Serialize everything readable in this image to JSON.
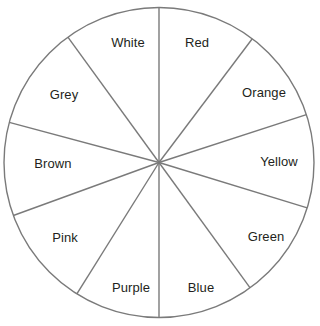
{
  "figure": {
    "type": "pie-wheel",
    "title": "",
    "background_color": "#ffffff",
    "stroke_color": "#7a7a7a",
    "stroke_width": 1.4,
    "fill_color": "#ffffff",
    "label_color": "#231f20",
    "label_font_size_px": 13,
    "center": {
      "x": 159,
      "y": 162.5
    },
    "radius": 155
  },
  "chart_data": {
    "type": "pie",
    "title": "",
    "xlabel": "",
    "ylabel": "",
    "legend_position": "none",
    "grid": false,
    "note": "Spinner wheel divided into 10 unequal sectors, each labelled with a colour name. Sector boundary angles measured in degrees counter-clockwise from the positive x-axis (3 o'clock).",
    "categories": [
      "Red",
      "Orange",
      "Yellow",
      "Green",
      "Blue",
      "Purple",
      "Pink",
      "Brown",
      "Grey",
      "White"
    ],
    "values": [
      37,
      35,
      35,
      37,
      36,
      32,
      38,
      35,
      39,
      36
    ],
    "unit": "degrees",
    "total_degrees": 360,
    "sectors": [
      {
        "label": "Red",
        "start_deg": 53,
        "end_deg": 90,
        "span_deg": 37,
        "label_x": 197,
        "label_y": 43
      },
      {
        "label": "Orange",
        "start_deg": 18,
        "end_deg": 53,
        "span_deg": 35,
        "label_x": 264,
        "label_y": 93
      },
      {
        "label": "Yellow",
        "start_deg": -17,
        "end_deg": 18,
        "span_deg": 35,
        "label_x": 279,
        "label_y": 162
      },
      {
        "label": "Green",
        "start_deg": -54,
        "end_deg": -17,
        "span_deg": 37,
        "label_x": 266,
        "label_y": 237
      },
      {
        "label": "Blue",
        "start_deg": -90,
        "end_deg": -54,
        "span_deg": 36,
        "label_x": 201,
        "label_y": 288
      },
      {
        "label": "Purple",
        "start_deg": -122,
        "end_deg": -90,
        "span_deg": 32,
        "label_x": 131,
        "label_y": 288
      },
      {
        "label": "Pink",
        "start_deg": -160,
        "end_deg": -122,
        "span_deg": 38,
        "label_x": 65,
        "label_y": 238
      },
      {
        "label": "Brown",
        "start_deg": 165,
        "end_deg": 200,
        "span_deg": 35,
        "label_x": 53,
        "label_y": 164
      },
      {
        "label": "Grey",
        "start_deg": 126,
        "end_deg": 165,
        "span_deg": 39,
        "label_x": 64,
        "label_y": 95
      },
      {
        "label": "White",
        "start_deg": 90,
        "end_deg": 126,
        "span_deg": 36,
        "label_x": 128,
        "label_y": 43
      }
    ]
  }
}
